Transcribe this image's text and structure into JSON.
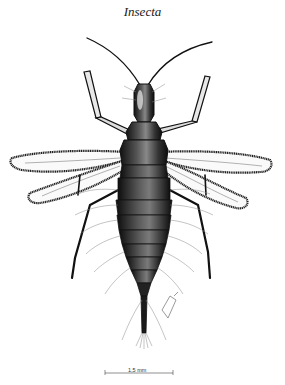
{
  "figure": {
    "title": "Insecta",
    "style": "black-and-white pen-and-ink scientific drawing",
    "scale_bar": {
      "label": "1,5 mm"
    },
    "signature": "artist signature"
  },
  "colors": {
    "background": "#ffffff",
    "ink": "#111111",
    "hair": "#888888"
  }
}
